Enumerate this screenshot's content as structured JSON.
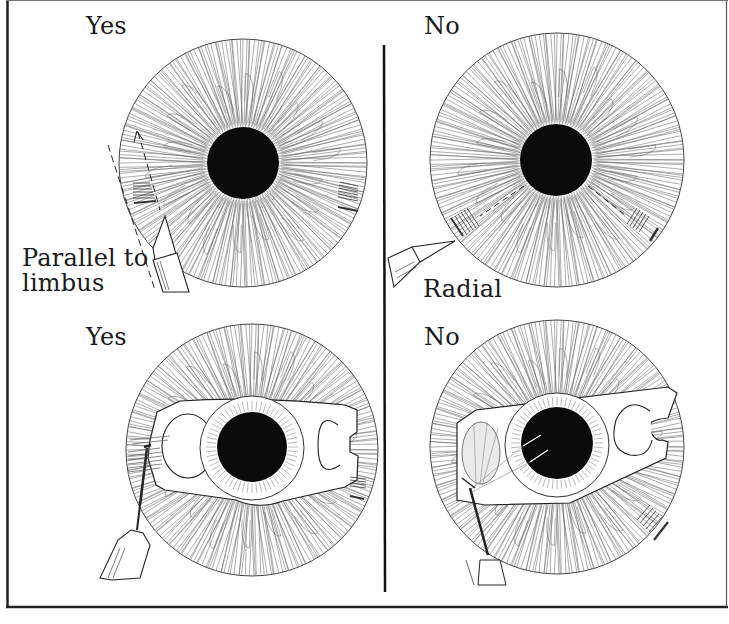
{
  "figure": {
    "colors": {
      "ink": "#1a1a1a",
      "pupil": "#0a0a0a",
      "background": "#ffffff",
      "frame": "#222222"
    },
    "panels": [
      {
        "id": "top-left",
        "verdict": "Yes",
        "caption": "Parallel to limbus",
        "caption_lines": [
          "Parallel to",
          "limbus"
        ],
        "elements": [
          "iris",
          "pupil",
          "scalpel-blade",
          "dashed-incision-arrow",
          "hatched-marks-left",
          "hatched-marks-right"
        ]
      },
      {
        "id": "top-right",
        "verdict": "No",
        "caption": "Radial",
        "elements": [
          "iris",
          "pupil",
          "scalpel-blade",
          "radial-dashed-lines",
          "hatched-marks-left",
          "hatched-marks-right"
        ]
      },
      {
        "id": "bottom-left",
        "verdict": "Yes",
        "elements": [
          "iris",
          "pupil",
          "lens-implant-optic",
          "haptic-plate",
          "forceps-instrument",
          "hatched-marks-right"
        ]
      },
      {
        "id": "bottom-right",
        "verdict": "No",
        "elements": [
          "iris",
          "pupil",
          "lens-implant-optic",
          "tilted-haptic-plate",
          "forceps-instrument",
          "tear-lines",
          "hatched-marks-right"
        ]
      }
    ]
  }
}
